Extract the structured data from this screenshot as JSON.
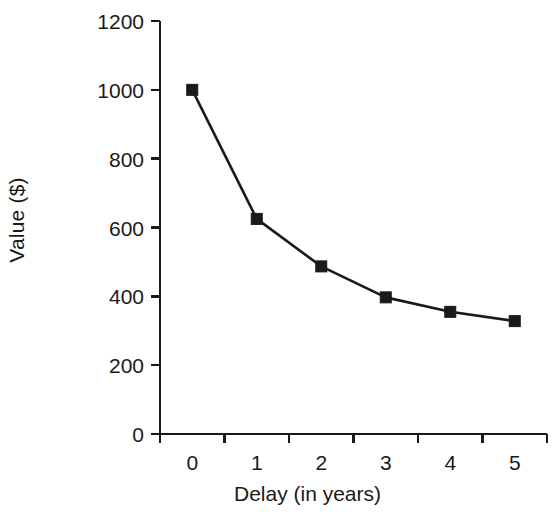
{
  "chart_data": {
    "type": "line",
    "title": "",
    "subtitle": "",
    "xlabel": "Delay (in years)",
    "ylabel": "Value ($)",
    "x": [
      0,
      1,
      2,
      3,
      4,
      5
    ],
    "values": [
      1000,
      625,
      487,
      397,
      355,
      328
    ],
    "series": [
      {
        "name": "Subjective value",
        "values": [
          1000,
          625,
          487,
          397,
          355,
          328
        ],
        "marker": "filled-square",
        "color": "#1a1a1a",
        "line_color": "#1a1a1a"
      }
    ],
    "xlim": [
      -0.5,
      5.5
    ],
    "ylim": [
      0,
      1200
    ],
    "xticks": [
      0,
      1,
      2,
      3,
      4,
      5
    ],
    "yticks": [
      0,
      200,
      400,
      600,
      800,
      1000,
      1200
    ],
    "xtick_labels": [
      "0",
      "1",
      "2",
      "3",
      "4",
      "5"
    ],
    "ytick_labels": [
      "0",
      "200",
      "400",
      "600",
      "800",
      "1000",
      "1200"
    ],
    "grid": false,
    "legend": false,
    "legend_position": "none",
    "annotations": [],
    "spines": [
      "left",
      "bottom"
    ],
    "background_color": "#ffffff",
    "axis_color": "#1a1a1a"
  }
}
